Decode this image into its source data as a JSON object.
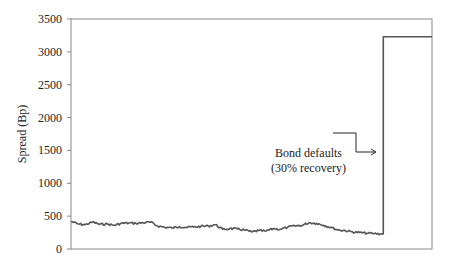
{
  "chart_data": {
    "type": "line",
    "title": "",
    "xlabel": "",
    "ylabel": "Spread (Bp)",
    "ylim": [
      0,
      3500
    ],
    "yticks": [
      0,
      500,
      1000,
      1500,
      2000,
      2500,
      3000,
      3500
    ],
    "grid": false,
    "legend": null,
    "annotation": {
      "lines": [
        "Bond defaults",
        "(30% recovery)"
      ],
      "arrow_target": "jump in spread"
    },
    "series": [
      {
        "name": "Spread",
        "color": "#555555",
        "x": [
          0,
          0.02,
          0.04,
          0.06,
          0.08,
          0.1,
          0.12,
          0.14,
          0.16,
          0.18,
          0.2,
          0.22,
          0.24,
          0.26,
          0.28,
          0.3,
          0.32,
          0.34,
          0.36,
          0.38,
          0.4,
          0.42,
          0.44,
          0.46,
          0.48,
          0.5,
          0.52,
          0.54,
          0.56,
          0.58,
          0.6,
          0.62,
          0.64,
          0.66,
          0.68,
          0.7,
          0.72,
          0.74,
          0.76,
          0.78,
          0.8,
          0.82,
          0.84,
          0.86,
          0.865,
          0.88,
          0.9,
          0.92,
          0.94,
          0.96,
          0.98,
          1.0
        ],
        "values": [
          420,
          380,
          370,
          410,
          375,
          380,
          360,
          390,
          395,
          390,
          400,
          410,
          350,
          330,
          320,
          340,
          330,
          335,
          345,
          350,
          370,
          300,
          310,
          305,
          290,
          260,
          280,
          270,
          310,
          300,
          330,
          350,
          360,
          400,
          390,
          360,
          330,
          290,
          280,
          260,
          250,
          240,
          235,
          230,
          3230,
          3230,
          3230,
          3230,
          3230,
          3230,
          3230,
          3230
        ]
      }
    ]
  }
}
